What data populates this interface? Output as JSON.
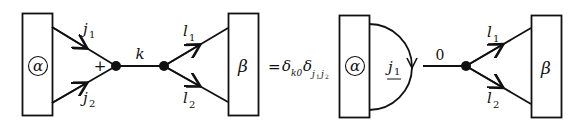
{
  "diagram": {
    "left": {
      "box_alpha": {
        "label": "α"
      },
      "incoming_edges": [
        {
          "label_main": "j",
          "label_sub": "1"
        },
        {
          "label_main": "j",
          "label_sub": "2"
        }
      ],
      "vertex_sign": "+",
      "middle_edge": {
        "label": "k"
      },
      "outgoing_edges": [
        {
          "label_main": "l",
          "label_sub": "1"
        },
        {
          "label_main": "l",
          "label_sub": "2"
        }
      ],
      "box_beta": {
        "label": "β"
      }
    },
    "equation": {
      "equals": "=",
      "delta1": {
        "symbol": "δ",
        "sub": "k0"
      },
      "delta2": {
        "symbol": "δ",
        "sub_main_a": "j",
        "sub_a": "1",
        "sub_main_b": "j",
        "sub_b": "2"
      }
    },
    "right": {
      "box_alpha": {
        "label": "α"
      },
      "loop_edge": {
        "label_main": "j",
        "label_sub": "1"
      },
      "middle_edge": {
        "label": "0"
      },
      "outgoing_edges": [
        {
          "label_main": "l",
          "label_sub": "1"
        },
        {
          "label_main": "l",
          "label_sub": "2"
        }
      ],
      "box_beta": {
        "label": "β"
      }
    }
  },
  "colors": {
    "stroke": "#111111",
    "background": "#ffffff"
  }
}
